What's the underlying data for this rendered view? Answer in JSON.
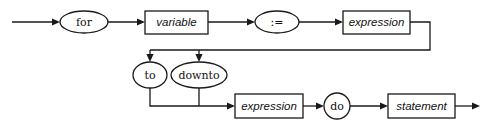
{
  "diagram": {
    "kind": "railroad-syntax-diagram",
    "name": "for-statement",
    "colors": {
      "background": "#ffffff",
      "line": "#1a1a1a",
      "node_fill": "#ffffff",
      "text": "#111111"
    },
    "nodes": {
      "for_keyword": {
        "label": "for",
        "shape": "ellipse",
        "type": "terminal",
        "cx": 84,
        "cy": 22,
        "rx": 24,
        "ry": 11
      },
      "variable": {
        "label": "variable",
        "shape": "rect",
        "type": "nonterminal",
        "x": 145,
        "y": 11,
        "w": 63,
        "h": 23
      },
      "assign_operator": {
        "label": ":=",
        "shape": "ellipse",
        "type": "terminal",
        "cx": 277,
        "cy": 22,
        "rx": 22,
        "ry": 11
      },
      "expression_initial": {
        "label": "expression",
        "shape": "rect",
        "type": "nonterminal",
        "x": 343,
        "y": 11,
        "w": 67,
        "h": 23
      },
      "to_keyword": {
        "label": "to",
        "shape": "ellipse",
        "type": "terminal",
        "cx": 150,
        "cy": 75,
        "rx": 17,
        "ry": 13
      },
      "downto_keyword": {
        "label": "downto",
        "shape": "ellipse",
        "type": "terminal",
        "cx": 199,
        "cy": 75,
        "rx": 28,
        "ry": 13
      },
      "expression_limit": {
        "label": "expression",
        "shape": "rect",
        "type": "nonterminal",
        "x": 235,
        "y": 94,
        "w": 68,
        "h": 24
      },
      "do_keyword": {
        "label": "do",
        "shape": "circle",
        "type": "terminal",
        "cx": 337,
        "cy": 106,
        "r": 13
      },
      "statement": {
        "label": "statement",
        "shape": "rect",
        "type": "nonterminal",
        "x": 388,
        "y": 94,
        "w": 67,
        "h": 24
      }
    },
    "edges": {
      "entry": {
        "from": "start",
        "to": "for_keyword"
      },
      "for_to_variable": {
        "from": "for_keyword",
        "to": "variable"
      },
      "variable_to_assign": {
        "from": "variable",
        "to": "assign_operator"
      },
      "assign_to_expression": {
        "from": "assign_operator",
        "to": "expression_initial"
      },
      "expression_to_branch": {
        "from": "expression_initial",
        "to": "branch-bus"
      },
      "branch_to_to": {
        "from": "branch-bus",
        "to": "to_keyword"
      },
      "branch_to_downto": {
        "from": "branch-bus",
        "to": "downto_keyword"
      },
      "to_merge": {
        "from": "to_keyword",
        "to": "merge-bus"
      },
      "downto_merge": {
        "from": "downto_keyword",
        "to": "merge-bus"
      },
      "merge_to_expression": {
        "from": "merge-bus",
        "to": "expression_limit"
      },
      "expression_to_do": {
        "from": "expression_limit",
        "to": "do_keyword"
      },
      "do_to_statement": {
        "from": "do_keyword",
        "to": "statement"
      },
      "exit": {
        "from": "statement",
        "to": "end"
      }
    }
  }
}
